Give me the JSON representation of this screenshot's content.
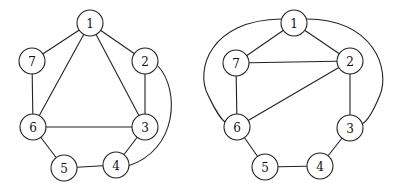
{
  "graphs": [
    {
      "id": "left",
      "nodes": [
        {
          "id": "1",
          "label": "1",
          "x": 90,
          "y": 23
        },
        {
          "id": "2",
          "label": "2",
          "x": 145,
          "y": 61
        },
        {
          "id": "3",
          "label": "3",
          "x": 145,
          "y": 127
        },
        {
          "id": "4",
          "label": "4",
          "x": 116,
          "y": 165
        },
        {
          "id": "5",
          "label": "5",
          "x": 64,
          "y": 168
        },
        {
          "id": "6",
          "label": "6",
          "x": 33,
          "y": 127
        },
        {
          "id": "7",
          "label": "7",
          "x": 32,
          "y": 61
        }
      ],
      "edges": [
        {
          "from": "1",
          "to": "7"
        },
        {
          "from": "1",
          "to": "2"
        },
        {
          "from": "1",
          "to": "6"
        },
        {
          "from": "1",
          "to": "3"
        },
        {
          "from": "7",
          "to": "6"
        },
        {
          "from": "2",
          "to": "3"
        },
        {
          "from": "6",
          "to": "3"
        },
        {
          "from": "6",
          "to": "5"
        },
        {
          "from": "5",
          "to": "4"
        },
        {
          "from": "3",
          "to": "4"
        },
        {
          "from": "2",
          "to": "4",
          "curved": true,
          "path": "M158,66 C180,90 178,150 128,166"
        }
      ]
    },
    {
      "id": "right",
      "nodes": [
        {
          "id": "1",
          "label": "1",
          "x": 294,
          "y": 23
        },
        {
          "id": "2",
          "label": "2",
          "x": 350,
          "y": 61
        },
        {
          "id": "3",
          "label": "3",
          "x": 350,
          "y": 128
        },
        {
          "id": "4",
          "label": "4",
          "x": 320,
          "y": 166
        },
        {
          "id": "5",
          "label": "5",
          "x": 265,
          "y": 167
        },
        {
          "id": "6",
          "label": "6",
          "x": 237,
          "y": 127
        },
        {
          "id": "7",
          "label": "7",
          "x": 236,
          "y": 63
        }
      ],
      "edges": [
        {
          "from": "1",
          "to": "7"
        },
        {
          "from": "1",
          "to": "2"
        },
        {
          "from": "7",
          "to": "2"
        },
        {
          "from": "7",
          "to": "6"
        },
        {
          "from": "6",
          "to": "2"
        },
        {
          "from": "2",
          "to": "3"
        },
        {
          "from": "3",
          "to": "4"
        },
        {
          "from": "4",
          "to": "5"
        },
        {
          "from": "5",
          "to": "6"
        },
        {
          "from": "1",
          "to": "6",
          "curved": true,
          "path": "M281,19 C210,20 195,70 208,95 C215,110 222,120 225,122"
        },
        {
          "from": "1",
          "to": "3",
          "curved": true,
          "path": "M307,19 C375,20 390,70 380,95 C373,112 366,122 362,124"
        }
      ]
    }
  ]
}
